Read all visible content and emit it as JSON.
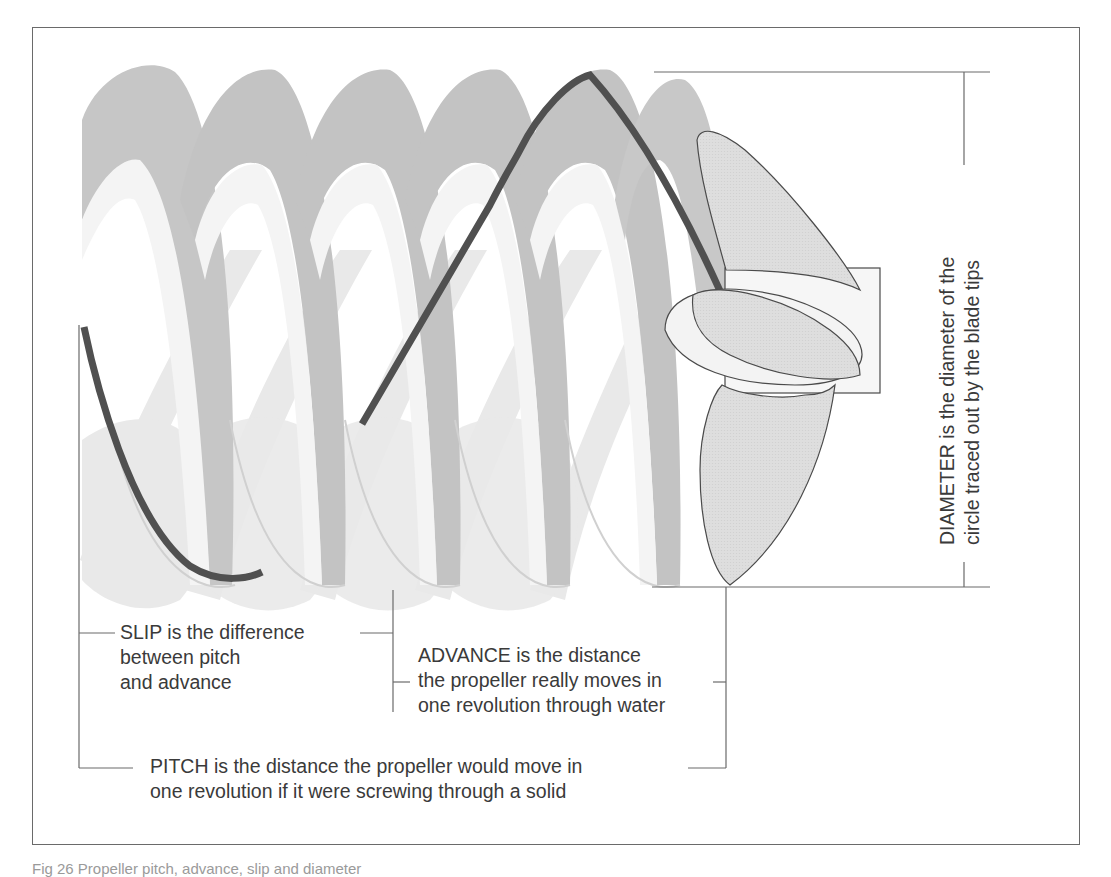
{
  "figure": {
    "caption": "Fig 26 Propeller pitch, advance, slip and diameter",
    "colors": {
      "helix_dark": "#c4c4c4",
      "helix_light": "#e6e6e6",
      "helix_edge": "#f2f2f2",
      "track_line": "#505050",
      "propeller_fill": "#dcdcdc",
      "propeller_outline": "#4a4a4a",
      "leader_lines": "#6a6a6a",
      "text": "#3a3a3a"
    }
  },
  "labels": {
    "slip": {
      "lines": [
        "SLIP is the difference",
        "between pitch",
        "and advance"
      ]
    },
    "advance": {
      "lines": [
        "ADVANCE is the distance",
        "the propeller really moves in",
        "one revolution through water"
      ]
    },
    "pitch": {
      "lines": [
        "PITCH is the distance the propeller would move in",
        "one revolution if it were screwing through a solid"
      ]
    },
    "diameter": {
      "lines": [
        "DIAMETER is the diameter of the",
        "circle traced out by the blade tips"
      ]
    }
  },
  "elements": {
    "helix_turns": 5,
    "propeller_blades": 3
  }
}
